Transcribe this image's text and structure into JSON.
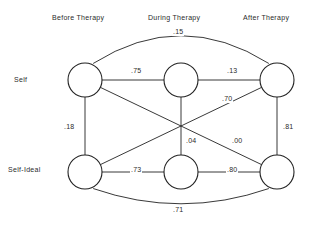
{
  "figure": {
    "column_headers": [
      {
        "label": "Before Therapy",
        "x": 52,
        "y": 14
      },
      {
        "label": "During Therapy",
        "x": 148,
        "y": 14
      },
      {
        "label": "After Therapy",
        "x": 243,
        "y": 14
      }
    ],
    "row_labels": [
      {
        "label": "Self",
        "x": 14,
        "y": 76
      },
      {
        "label": "Self-Ideal",
        "x": 8,
        "y": 166
      }
    ],
    "nodes": [
      {
        "id": "self-before",
        "cx": 85,
        "cy": 80,
        "r": 17
      },
      {
        "id": "self-during",
        "cx": 181,
        "cy": 80,
        "r": 17
      },
      {
        "id": "self-after",
        "cx": 277,
        "cy": 80,
        "r": 17
      },
      {
        "id": "ideal-before",
        "cx": 85,
        "cy": 172,
        "r": 17
      },
      {
        "id": "ideal-during",
        "cx": 181,
        "cy": 172,
        "r": 17
      },
      {
        "id": "ideal-after",
        "cx": 277,
        "cy": 172,
        "r": 17
      }
    ],
    "edges": [
      {
        "id": "self-before--self-during",
        "from": "self-before",
        "to": "self-during",
        "kind": "line",
        "value": ".75",
        "label_x": 130,
        "label_y": 67
      },
      {
        "id": "self-during--self-after",
        "from": "self-during",
        "to": "self-after",
        "kind": "line",
        "value": ".13",
        "label_x": 226,
        "label_y": 67
      },
      {
        "id": "self-before--self-after",
        "from": "self-before",
        "to": "self-after",
        "kind": "arc",
        "value": ".15",
        "label_x": 172,
        "label_y": 28
      },
      {
        "id": "ideal-before--ideal-during",
        "from": "ideal-before",
        "to": "ideal-during",
        "kind": "line",
        "value": ".73",
        "label_x": 130,
        "label_y": 166
      },
      {
        "id": "ideal-during--ideal-after",
        "from": "ideal-during",
        "to": "ideal-after",
        "kind": "line",
        "value": ".80",
        "label_x": 226,
        "label_y": 166
      },
      {
        "id": "ideal-before--ideal-after",
        "from": "ideal-before",
        "to": "ideal-after",
        "kind": "arc",
        "value": ".71",
        "label_x": 172,
        "label_y": 206
      },
      {
        "id": "self-before--ideal-before",
        "from": "self-before",
        "to": "ideal-before",
        "kind": "line",
        "value": ".18",
        "label_x": 63,
        "label_y": 123
      },
      {
        "id": "self-during--ideal-during",
        "from": "self-during",
        "to": "ideal-during",
        "kind": "line",
        "value": ".04",
        "label_x": 185,
        "label_y": 137
      },
      {
        "id": "self-after--ideal-after",
        "from": "self-after",
        "to": "ideal-after",
        "kind": "line",
        "value": ".81",
        "label_x": 282,
        "label_y": 123
      },
      {
        "id": "self-before--ideal-after",
        "from": "self-before",
        "to": "ideal-after",
        "kind": "line",
        "value": ".00",
        "label_x": 231,
        "label_y": 137
      },
      {
        "id": "ideal-before--self-after",
        "from": "ideal-before",
        "to": "self-after",
        "kind": "line",
        "value": ".70",
        "label_x": 221,
        "label_y": 95
      }
    ]
  }
}
